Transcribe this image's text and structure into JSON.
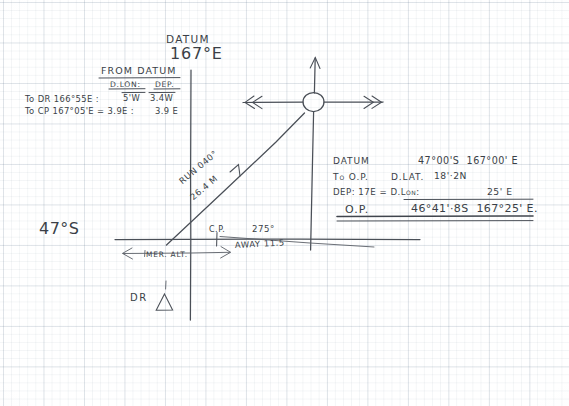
{
  "sheet": {
    "title": "Navigation plotting worksheet (graph paper)",
    "ink_color": "#3a3f47",
    "grid_color": "#6e829b"
  },
  "datum": {
    "word": "DATUM",
    "longitude": "167°E",
    "latitude_label": "47°S"
  },
  "from_datum_table": {
    "title": "FROM DATUM",
    "col_dlon": "D.LON:",
    "col_dep": "DEP.",
    "rows": [
      {
        "label": "To DR 166°55E :",
        "dlon": "5'W",
        "eq": "=",
        "dep": "3.4W"
      },
      {
        "label": "To CP 167°05'E = 3.9E :",
        "dlon": "",
        "eq": "",
        "dep": "3.9 E"
      }
    ]
  },
  "plot_labels": {
    "run_bearing": "RUN 040°",
    "run_distance": "26.4 M",
    "cp": "C.P.",
    "bearing_275": "275°",
    "away": "AWAY 11.5",
    "mer_alt": "MER. ALT.",
    "dr": "DR"
  },
  "result_panel": {
    "line1_label": "DATUM",
    "line1_value": "47°00'S  167°00' E",
    "line2_label": "To O.P.",
    "line2_mid": "D.LAT.",
    "line2_value": "18'·2N",
    "line3_label": "DEP: 17E = D.Lon:",
    "line3_value": "25' E",
    "line4_label": "O.P.",
    "line4_value": "46°41'·8S  167°25' E."
  }
}
